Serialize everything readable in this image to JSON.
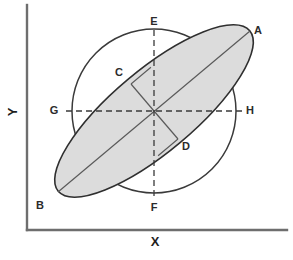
{
  "figure": {
    "title": "",
    "type": "geometric-diagram"
  },
  "axes": {
    "x_label": "X",
    "y_label": "Y",
    "x_axis_name": "x-axis",
    "y_axis_name": "y-axis",
    "origin": {
      "x": 27,
      "y": 230
    },
    "x_end": {
      "x": 287,
      "y": 230
    },
    "y_end": {
      "x": 27,
      "y": 5
    },
    "color": "#6e6e6e"
  },
  "center": {
    "x": 154,
    "y": 111
  },
  "circle": {
    "name": "reference-circle",
    "cx": 154,
    "cy": 111,
    "r": 82,
    "stroke": "#3a3a3a",
    "fill": "none"
  },
  "ellipse": {
    "name": "shaded-ellipse",
    "cx": 154,
    "cy": 111,
    "rx": 125,
    "ry": 41,
    "rotation_deg": -40,
    "fill": "#dcdcdc",
    "stroke": "#2f2f2f"
  },
  "labels": [
    {
      "id": "A",
      "text": "A",
      "x": 258,
      "y": 31,
      "role": "ellipse-major-axis-end"
    },
    {
      "id": "B",
      "text": "B",
      "x": 40,
      "y": 206,
      "role": "ellipse-major-axis-end"
    },
    {
      "id": "C",
      "text": "C",
      "x": 119,
      "y": 73,
      "role": "ellipse-minor-axis-end"
    },
    {
      "id": "D",
      "text": "D",
      "x": 186,
      "y": 147,
      "role": "ellipse-minor-axis-end"
    },
    {
      "id": "E",
      "text": "E",
      "x": 154,
      "y": 22,
      "role": "circle-top"
    },
    {
      "id": "F",
      "text": "F",
      "x": 154,
      "y": 208,
      "role": "circle-bottom"
    },
    {
      "id": "G",
      "text": "G",
      "x": 54,
      "y": 111,
      "role": "circle-left"
    },
    {
      "id": "H",
      "text": "H",
      "x": 250,
      "y": 111,
      "role": "circle-right"
    }
  ],
  "lines": {
    "major_axis": {
      "name": "major-axis-line",
      "from": {
        "x": 58,
        "y": 192
      },
      "to": {
        "x": 250,
        "y": 31
      },
      "style": "solid",
      "stroke": "#5a5a5a"
    },
    "minor_axis_upper": {
      "name": "minor-axis-segment-c",
      "from": {
        "x": 154,
        "y": 111
      },
      "to": {
        "x": 131,
        "y": 84
      },
      "style": "solid",
      "stroke": "#5a5a5a"
    },
    "minor_axis_lower": {
      "name": "minor-axis-segment-d",
      "from": {
        "x": 154,
        "y": 111
      },
      "to": {
        "x": 178,
        "y": 139
      },
      "style": "solid",
      "stroke": "#5a5a5a"
    },
    "minor_cap_upper": {
      "name": "minor-axis-cap-upper",
      "from": {
        "x": 131,
        "y": 84
      },
      "to": {
        "x": 154,
        "y": 111
      },
      "style": "solid",
      "stroke": "#5a5a5a"
    },
    "vertical_dashed": {
      "name": "vertical-dashed-line-ef",
      "from": {
        "x": 154,
        "y": 30
      },
      "to": {
        "x": 154,
        "y": 199
      },
      "style": "dashed",
      "stroke": "#3a3a3a"
    },
    "horizontal_dashed": {
      "name": "horizontal-dashed-line-gh",
      "from": {
        "x": 66,
        "y": 111
      },
      "to": {
        "x": 242,
        "y": 111
      },
      "style": "dashed",
      "stroke": "#3a3a3a"
    },
    "diagonal_dashed_upper": {
      "name": "diagonal-dashed-upper",
      "from": {
        "x": 154,
        "y": 111
      },
      "to": {
        "x": 131,
        "y": 84
      },
      "style": "solid",
      "stroke": "#5a5a5a"
    }
  }
}
